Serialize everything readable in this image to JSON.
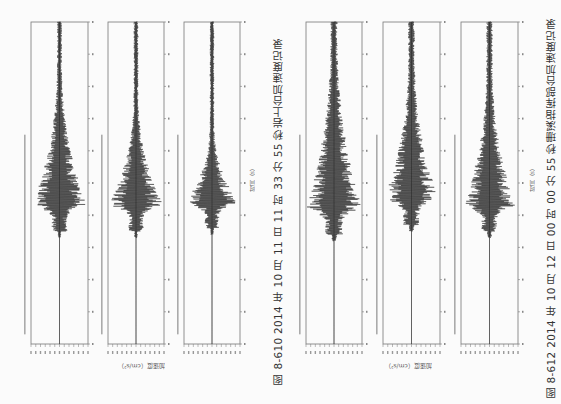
{
  "figures": [
    {
      "id": "fig-8-610",
      "caption": "图 8-610   2014 年 10 月 11 日 11 时 33 分 55 秒岩上台加速度记录",
      "ylabel": "加速度（cm/s²）",
      "xlabel": "时间（s）"
    },
    {
      "id": "fig-8-612",
      "caption": "图 8-612   2014 年 10 月 12 日 00 时 00 分 55 秒珊溪指挥部台加速度记录",
      "ylabel": "加速度（cm/s²）",
      "xlabel": "时间（s）"
    }
  ],
  "chart_data": [
    {
      "type": "line",
      "title": "图 8-610 2014 年 10 月 11 日 11 时 33 分 55 秒岩上台加速度记录",
      "xlabel": "时间（s）",
      "ylabel": "加速度（cm/s²）",
      "orientation": "rotated-90",
      "grid": false,
      "series": [
        {
          "name": "Acceleration component 1",
          "box": [
            31,
            22,
            88,
            344
          ],
          "peak_pos": 0.57,
          "peak_amp": 0.95,
          "envelope": "emergent, long coda",
          "buildup": 0.45
        },
        {
          "name": "Acceleration component 2",
          "box": [
            108,
            22,
            164,
            344
          ],
          "peak_pos": 0.57,
          "peak_amp": 0.95,
          "envelope": "spindle",
          "buildup": 0.35
        },
        {
          "name": "Acceleration component 3",
          "box": [
            184,
            22,
            240,
            344
          ],
          "peak_pos": 0.56,
          "peak_amp": 0.9,
          "envelope": "impulsive spindle",
          "buildup": 0.25
        }
      ],
      "time_ticks": 10
    },
    {
      "type": "line",
      "title": "图 8-612 2014 年 10 月 12 日 00 时 00 分 55 秒珊溪指挥部台加速度记录",
      "xlabel": "时间（s）",
      "ylabel": "加速度（cm/s²）",
      "orientation": "rotated-90",
      "grid": false,
      "series": [
        {
          "name": "Acceleration component 1",
          "box": [
            306,
            22,
            362,
            344
          ],
          "peak_pos": 0.58,
          "peak_amp": 0.95,
          "envelope": "noisy, long buildup",
          "buildup": 0.55
        },
        {
          "name": "Acceleration component 2",
          "box": [
            383,
            22,
            440,
            344
          ],
          "peak_pos": 0.55,
          "peak_amp": 0.9,
          "envelope": "noisy spindle",
          "buildup": 0.45
        },
        {
          "name": "Acceleration component 3",
          "box": [
            461,
            22,
            518,
            344
          ],
          "peak_pos": 0.57,
          "peak_amp": 0.85,
          "envelope": "noisy spindle",
          "buildup": 0.45
        }
      ],
      "time_ticks": 10
    }
  ]
}
